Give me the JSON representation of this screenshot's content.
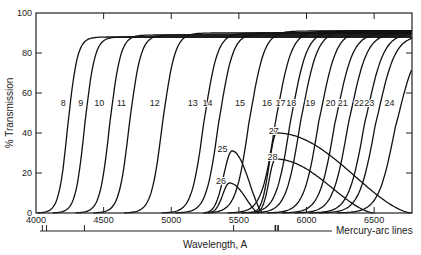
{
  "chart_data": {
    "type": "line",
    "title": "",
    "xlabel": "Wavelength, A",
    "ylabel": "% Transmission",
    "xlim": [
      4000,
      6780
    ],
    "ylim": [
      0,
      100
    ],
    "x_ticks": [
      4000,
      4500,
      5000,
      5500,
      6000,
      6500
    ],
    "y_ticks": [
      0,
      20,
      40,
      60,
      80,
      100
    ],
    "grid": false,
    "legend": "curve labels inline",
    "secondary_scale": {
      "label": "Mercury-arc lines",
      "lines_A": [
        4047,
        4078,
        4358,
        5461,
        5770,
        5790
      ]
    },
    "series": [
      {
        "name": "8",
        "kind": "longpass",
        "cutoff_50": 4235,
        "plateau": 88
      },
      {
        "name": "9",
        "kind": "longpass",
        "cutoff_50": 4360,
        "plateau": 88
      },
      {
        "name": "10",
        "kind": "longpass",
        "cutoff_50": 4545,
        "plateau": 89
      },
      {
        "name": "11",
        "kind": "longpass",
        "cutoff_50": 4690,
        "plateau": 89
      },
      {
        "name": "12",
        "kind": "longpass",
        "cutoff_50": 4935,
        "plateau": 90
      },
      {
        "name": "13",
        "kind": "longpass",
        "cutoff_50": 5240,
        "plateau": 90
      },
      {
        "name": "14",
        "kind": "longpass",
        "cutoff_50": 5350,
        "plateau": 90
      },
      {
        "name": "15",
        "kind": "longpass",
        "cutoff_50": 5575,
        "plateau": 91
      },
      {
        "name": "16",
        "kind": "longpass",
        "cutoff_50": 5770,
        "plateau": 91
      },
      {
        "name": "17",
        "kind": "longpass",
        "cutoff_50": 5880,
        "plateau": 91
      },
      {
        "name": "18",
        "kind": "longpass",
        "cutoff_50": 5955,
        "plateau": 91
      },
      {
        "name": "19",
        "kind": "longpass",
        "cutoff_50": 6090,
        "plateau": 91
      },
      {
        "name": "20",
        "kind": "longpass",
        "cutoff_50": 6210,
        "plateau": 90
      },
      {
        "name": "21",
        "kind": "longpass",
        "cutoff_50": 6310,
        "plateau": 90
      },
      {
        "name": "22",
        "kind": "longpass",
        "cutoff_50": 6430,
        "plateau": 90
      },
      {
        "name": "23",
        "kind": "longpass",
        "cutoff_50": 6510,
        "plateau": 89
      },
      {
        "name": "24",
        "kind": "longpass",
        "cutoff_50": 6655,
        "plateau": 85
      },
      {
        "name": "25",
        "kind": "bandpass",
        "peak_A": 5450,
        "peak_T": 31,
        "start_A": 5250,
        "end_A": 5680
      },
      {
        "name": "26",
        "kind": "bandpass",
        "peak_A": 5430,
        "peak_T": 15,
        "start_A": 5270,
        "end_A": 5650
      },
      {
        "name": "27",
        "kind": "bandpass",
        "peak_A": 5780,
        "peak_T": 40,
        "start_A": 5600,
        "end_A": 6780,
        "tail_T": 5
      },
      {
        "name": "28",
        "kind": "bandpass",
        "peak_A": 5770,
        "peak_T": 27,
        "start_A": 5620,
        "end_A": 6500
      }
    ],
    "label_positions": {
      "8": [
        4235,
        55
      ],
      "9": [
        4365,
        55
      ],
      "10": [
        4520,
        55
      ],
      "11": [
        4680,
        55
      ],
      "12": [
        4930,
        55
      ],
      "13": [
        5210,
        55
      ],
      "14": [
        5320,
        55
      ],
      "15": [
        5560,
        55
      ],
      "16": [
        5760,
        55
      ],
      "17": [
        5860,
        55
      ],
      "18": [
        5940,
        55
      ],
      "19": [
        6080,
        55
      ],
      "20": [
        6230,
        55
      ],
      "21": [
        6320,
        55
      ],
      "22": [
        6440,
        55
      ],
      "23": [
        6515,
        55
      ],
      "24": [
        6665,
        55
      ],
      "25": [
        5430,
        32
      ],
      "26": [
        5420,
        16
      ],
      "27": [
        5810,
        41
      ],
      "28": [
        5800,
        28
      ]
    }
  },
  "axes": {
    "ylabel": "% Transmission",
    "xlabel": "Wavelength, A",
    "mercury_label": "Mercury-arc lines"
  }
}
